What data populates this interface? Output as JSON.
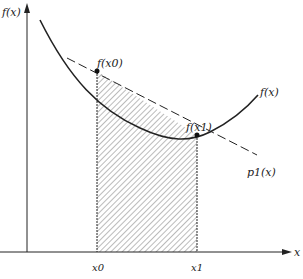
{
  "diagram": {
    "y_axis_label": "f(x)",
    "x_axis_label": "x",
    "curve_label": "f(x)",
    "line_label": "p1(x)",
    "point0_label": "f(x0)",
    "point1_label": "f(x1)",
    "tick0": {
      "label": "x0",
      "alt": "a",
      "alpha": "α = 0"
    },
    "tick1": {
      "label": "x1",
      "alt": "b",
      "alpha": "α = 1"
    },
    "colors": {
      "ink": "#222222",
      "hatch": "#555555",
      "background": "#ffffff"
    }
  }
}
